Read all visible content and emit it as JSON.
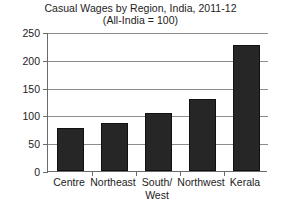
{
  "chart_data": {
    "type": "bar",
    "title": "Casual Wages by Region, India, 2011-12",
    "subtitle": "(All-India = 100)",
    "title_lines": [
      "Casual Wages by Region, India, 2011-12",
      "(All-India = 100)"
    ],
    "xlabel": "",
    "ylabel": "",
    "categories": [
      "Centre",
      "Northeast",
      "South/ West",
      "Northwest",
      "Kerala"
    ],
    "category_lines": [
      [
        "Centre"
      ],
      [
        "Northeast"
      ],
      [
        "South/",
        "West"
      ],
      [
        "Northwest"
      ],
      [
        "Kerala"
      ]
    ],
    "values": [
      78,
      87,
      105,
      129,
      227
    ],
    "ylim": [
      0,
      250
    ],
    "yticks": [
      0,
      50,
      100,
      150,
      200,
      250
    ],
    "ytick_labels": [
      "0",
      "50",
      "100",
      "150",
      "200",
      "250"
    ],
    "grid": true,
    "grid_axis": "y",
    "legend": null,
    "bar_color": "#262626",
    "grid_color": "#8c8c8c",
    "axis_color": "#6b6b6b",
    "text_color": "#1c1c1c",
    "background": "#ffffff"
  }
}
